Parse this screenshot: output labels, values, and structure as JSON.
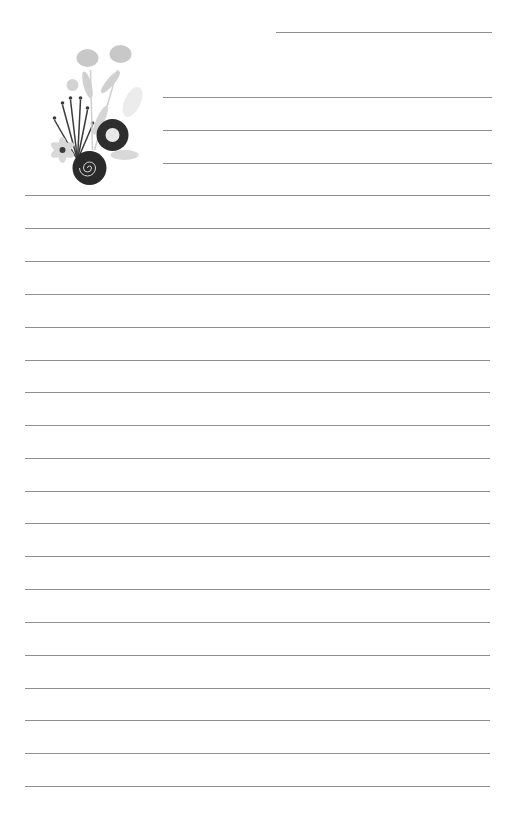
{
  "page": {
    "type": "lined-stationery",
    "background": "#ffffff",
    "line_color": "#8e8e8e",
    "decoration": "floral-bouquet-illustration"
  },
  "lines": {
    "top_short": {
      "y": 32,
      "x1": 276,
      "x2": 492
    },
    "partial": [
      {
        "y": 97,
        "x1": 163,
        "x2": 492
      },
      {
        "y": 130,
        "x1": 163,
        "x2": 492
      },
      {
        "y": 163,
        "x1": 163,
        "x2": 492
      }
    ],
    "full": [
      195,
      228,
      261,
      294,
      327,
      360,
      392,
      425,
      458,
      491,
      523,
      556,
      589,
      622,
      655,
      688,
      720,
      753,
      786
    ],
    "full_x1": 25,
    "full_x2": 490
  }
}
